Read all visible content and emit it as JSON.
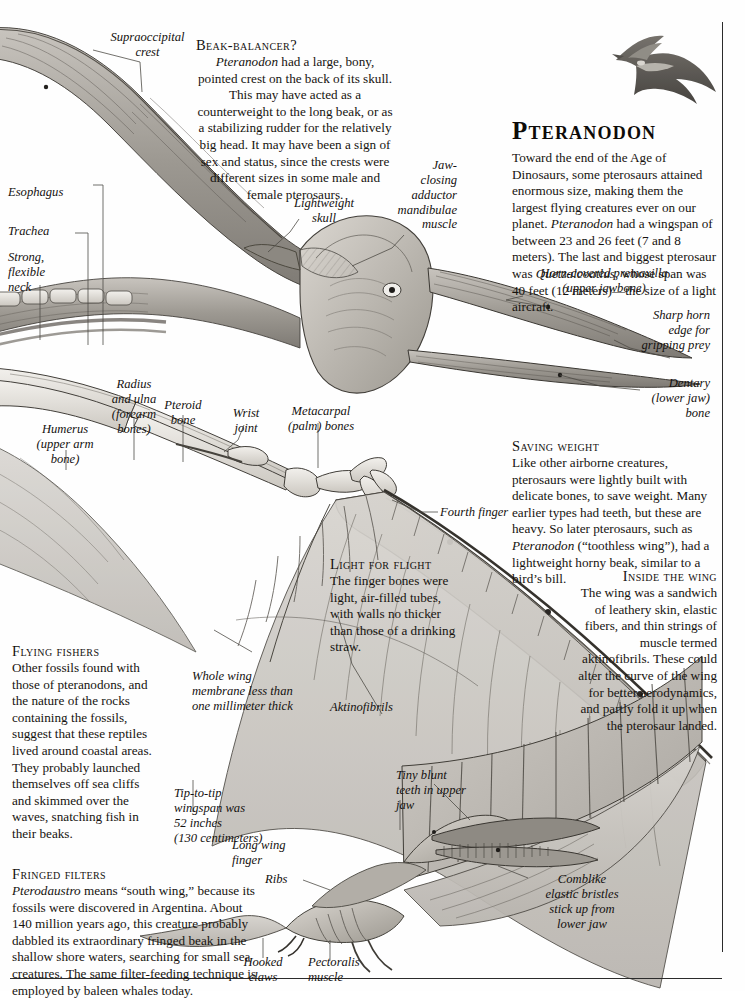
{
  "page": {
    "title": "PTERANODON",
    "background": "#ffffff",
    "ink": "#16130f",
    "rule_color": "#2b2b2b"
  },
  "main_article": {
    "heading": "Pteranodon",
    "body": "Toward the end of the Age of Dinosaurs, some pterosaurs attained enormous size, making them the largest flying creatures ever on our planet. Pteranodon had a wingspan of between 23 and 26 feet (7 and 8 meters). The last and biggest pterosaur was Quetzalcoatlus, whose span was 40 feet (12 meters)—the size of a light aircraft."
  },
  "sections": [
    {
      "id": "beak-balancer",
      "heading": "Beak-balancer?",
      "body": "Pteranodon had a large, bony, pointed crest on the back of its skull. This may have acted as a counterweight to the long beak, or as a stabilizing rudder for the relatively big head. It may have been a sign of sex and status, since the crests were different sizes in some male and female pterosaurs."
    },
    {
      "id": "saving-weight",
      "heading": "Saving weight",
      "body": "Like other airborne creatures, pterosaurs were lightly built with delicate bones, to save weight. Many earlier types had teeth, but these are heavy. So later pterosaurs, such as Pteranodon (“toothless wing”), had a lightweight horny beak, similar to a bird’s bill."
    },
    {
      "id": "light-for-flight",
      "heading": "Light for flight",
      "body": "The finger bones were light, air-filled tubes, with walls no thicker than those of a drinking straw."
    },
    {
      "id": "inside-the-wing",
      "heading": "Inside the wing",
      "body": "The wing was a sandwich of leathery skin, elastic fibers, and thin strings of muscle termed aktinofibrils. These could alter the curve of the wing for better aerodynamics, and partly fold it up when the pterosaur landed."
    },
    {
      "id": "flying-fishers",
      "heading": "Flying fishers",
      "body": "Other fossils found with those of pteranodons, and the nature of the rocks containing the fossils, suggest that these reptiles lived around coastal areas. They probably launched themselves off sea cliffs and skimmed over the waves, snatching fish in their beaks."
    },
    {
      "id": "fringed-filters",
      "heading": "Fringed filters",
      "body": "Pterodaustro means “south wing,” because its fossils were discovered in Argentina. About 140 million years ago, this creature probably dabbled its extraordinary fringed beak in the shallow shore waters, searching for small sea creatures. The same filter-feeding technique is employed by baleen whales today."
    }
  ],
  "labels": {
    "supraoccipital_crest": "Supraoccipital\ncrest",
    "esophagus": "Esophagus",
    "trachea": "Trachea",
    "strong_flexible_neck": "Strong,\nflexible\nneck",
    "lightweight_skull": "Lightweight\nskull",
    "jaw_closing_muscle": "Jaw-\nclosing\nadductor\nmandibulae\nmuscle",
    "horn_covered_premaxilla": "Horn-covered premaxilla\n(upper jawbone)",
    "sharp_horn_edge": "Sharp horn\nedge for\ngripping prey",
    "dentary": "Dentary\n(lower jaw)\nbone",
    "radius_and_ulna": "Radius\nand ulna\n(forearm\nbones)",
    "humerus": "Humerus\n(upper arm\nbone)",
    "pteroid_bone": "Pteroid\nbone",
    "wrist_joint": "Wrist\njoint",
    "metacarpal_bones": "Metacarpal\n(palm) bones",
    "fourth_finger": "Fourth finger",
    "whole_wing_membrane": "Whole wing\nmembrane less than\none millimeter thick",
    "aktinofibrils": "Aktinofibrils",
    "tip_to_tip_wingspan": "Tip-to-tip\nwingspan was\n52 inches\n(130 centimeters)",
    "long_wing_finger": "Long wing\nfinger",
    "ribs": "Ribs",
    "hooked_claws": "Hooked\nclaws",
    "pectoralis_muscle": "Pectoralis\nmuscle",
    "tiny_blunt_teeth": "Tiny blunt\nteeth in upper\njaw",
    "comblike_bristles": "Comblike\nelastic bristles\nstick up from\nlower jaw"
  },
  "figures": {
    "flying_pteranodon_vignette": "flying-pteranodon-silhouette",
    "main_skeleton": "pteranodon-wing-and-skull-cutaway",
    "pterodaustro": "pterodaustro-skeleton"
  }
}
